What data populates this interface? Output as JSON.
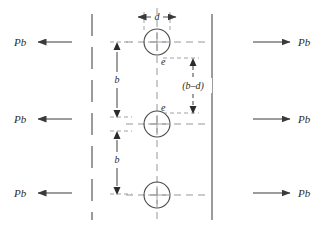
{
  "diagram": {
    "type": "engineering-line-diagram",
    "stroke_color": "#3a3a3a",
    "construction_color": "#7d7d7d",
    "background": "#ffffff",
    "canvas": {
      "width": 326,
      "height": 232
    }
  },
  "forces": {
    "left": [
      {
        "label": "Pb",
        "direction": "left",
        "y": 42
      },
      {
        "label": "Pb",
        "direction": "left",
        "y": 119
      },
      {
        "label": "Pb",
        "direction": "left",
        "y": 193
      }
    ],
    "right": [
      {
        "label": "Pb",
        "direction": "right",
        "y": 42
      },
      {
        "label": "Pb",
        "direction": "right",
        "y": 119
      },
      {
        "label": "Pb",
        "direction": "right",
        "y": 193
      }
    ]
  },
  "holes": [
    {
      "name": "rivet-hole-top",
      "cx": 157,
      "cy": 42,
      "r": 13
    },
    {
      "name": "rivet-hole-middle",
      "cx": 157,
      "cy": 124,
      "r": 13
    },
    {
      "name": "rivet-hole-bottom",
      "cx": 157,
      "cy": 195,
      "r": 13
    }
  ],
  "dimensions": {
    "d": {
      "label": "d",
      "orientation": "horizontal",
      "x1": 141,
      "x2": 173,
      "y": 17
    },
    "b_upper": {
      "label": "b",
      "orientation": "vertical",
      "x": 117,
      "y1": 42,
      "y2": 117
    },
    "b_lower": {
      "label": "b",
      "orientation": "vertical",
      "x": 117,
      "y1": 131,
      "y2": 194
    },
    "b_minus_d": {
      "label": "(b–d)",
      "orientation": "vertical",
      "x": 193,
      "y1": 58,
      "y2": 113
    }
  },
  "edge_marks": [
    {
      "label": "e",
      "x": 160,
      "y": 62,
      "note": "edge distance below top hole"
    },
    {
      "label": "e",
      "x": 160,
      "y": 108,
      "note": "edge distance above middle hole"
    }
  ],
  "guides": {
    "left_plate_edge": {
      "style": "long-dash",
      "x": 92,
      "y1": 14,
      "y2": 220
    },
    "right_plate_edge": {
      "style": "solid",
      "x": 212,
      "y1": 14,
      "y2": 220
    },
    "centerline": {
      "style": "dashed",
      "x": 157,
      "y1": 8,
      "y2": 224
    }
  }
}
